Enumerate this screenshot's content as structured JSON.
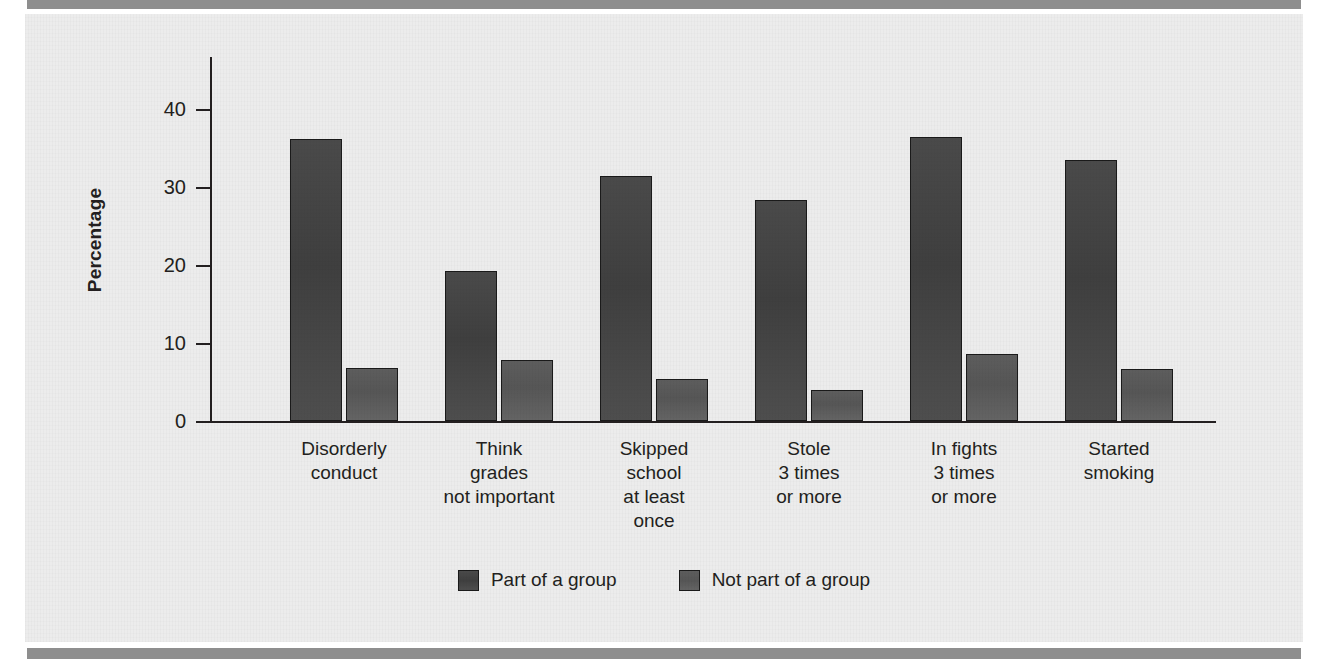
{
  "figure": {
    "background_color": "#ececec",
    "rule_color": "#8e8e8e",
    "axis_color": "#231f20"
  },
  "chart_data": {
    "type": "bar",
    "title": "",
    "xlabel": "",
    "ylabel": "Percentage",
    "ylim": [
      0,
      47
    ],
    "yticks": [
      0,
      10,
      20,
      30,
      40
    ],
    "ytick_labels": [
      "0",
      "10",
      "20",
      "30",
      "40"
    ],
    "grid": false,
    "legend_position": "bottom-center",
    "categories": [
      "Disorderly\nconduct",
      "Think\ngrades\nnot important",
      "Skipped\nschool\nat least\nonce",
      "Stole\n3 times\nor more",
      "In fights\n3 times\nor more",
      "Started\nsmoking"
    ],
    "category_lines": [
      [
        "Disorderly",
        "conduct"
      ],
      [
        "Think",
        "grades",
        "not important"
      ],
      [
        "Skipped",
        "school",
        "at least",
        "once"
      ],
      [
        "Stole",
        "3 times",
        "or more"
      ],
      [
        "In fights",
        "3 times",
        "or more"
      ],
      [
        "Started",
        "smoking"
      ]
    ],
    "series": [
      {
        "name": "Part of a group",
        "color": "#434343",
        "values": [
          36.1,
          19.2,
          31.4,
          28.3,
          36.4,
          33.5
        ]
      },
      {
        "name": "Not part of a group",
        "color": "#5b5b5b",
        "values": [
          6.8,
          7.8,
          5.4,
          4.0,
          8.6,
          6.7
        ]
      }
    ]
  },
  "legend": {
    "items": [
      {
        "label": "Part of a group",
        "swatch": "series-a"
      },
      {
        "label": "Not part of a group",
        "swatch": "series-b"
      }
    ]
  }
}
